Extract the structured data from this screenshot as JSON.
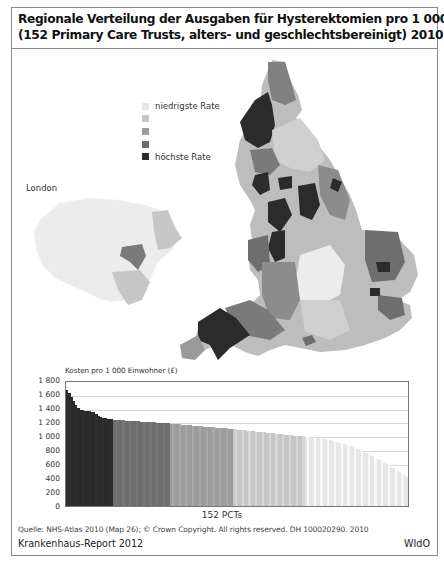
{
  "title": {
    "line1": "Regionale Verteilung der Ausgaben für Hysterektomien pro 1 000 Einwohner",
    "line2": "(152 Primary Care Trusts, alters- und geschlechtsbereinigt) 2010"
  },
  "map": {
    "legend": [
      {
        "label": "niedrigste Rate",
        "color": "#e6e6e6"
      },
      {
        "label": "",
        "color": "#c6c6c6"
      },
      {
        "label": "",
        "color": "#9c9c9c"
      },
      {
        "label": "",
        "color": "#6e6e6e"
      },
      {
        "label": "höchste Rate",
        "color": "#2b2b2b"
      }
    ],
    "inset_label": "London"
  },
  "chart_data": {
    "type": "bar",
    "title": "Kosten pro 1 000 Einwohner (£)",
    "xlabel": "152 PCTs",
    "ylabel": "Kosten pro 1 000 Einwohner (£)",
    "ylim": [
      0,
      1800
    ],
    "yticks": [
      "1 800",
      "1 600",
      "1 400",
      "1 200",
      "1 000",
      "800",
      "600",
      "400",
      "200",
      "0"
    ],
    "grid": true,
    "n_bars": 152,
    "bands": [
      {
        "name": "höchste Rate",
        "count": 21,
        "color": "#2b2b2b",
        "from": 1690,
        "to": 1260
      },
      {
        "name": "Quintil 4",
        "count": 25,
        "color": "#6e6e6e",
        "from": 1250,
        "to": 1200
      },
      {
        "name": "Quintil 3",
        "count": 28,
        "color": "#9c9c9c",
        "from": 1195,
        "to": 1120
      },
      {
        "name": "Quintil 2",
        "count": 32,
        "color": "#c6c6c6",
        "from": 1115,
        "to": 1010
      },
      {
        "name": "niedrigste Rate",
        "count": 46,
        "color": "#e6e6e6",
        "from": 1000,
        "to": 420
      }
    ],
    "values_approx": {
      "max": 1690,
      "min": 420,
      "first_bars": [
        1690,
        1640,
        1580,
        1520,
        1460,
        1420,
        1400,
        1390,
        1385,
        1380,
        1375,
        1370,
        1360,
        1340,
        1310,
        1290,
        1280,
        1275,
        1270,
        1265,
        1260
      ]
    }
  },
  "source": "Quelle: NHS-Atlas 2010 (Map 26); © Crown Copyright. All rights reserved. DH 100020290. 2010",
  "footer": {
    "left": "Krankenhaus-Report 2012",
    "right": "WIdO"
  }
}
